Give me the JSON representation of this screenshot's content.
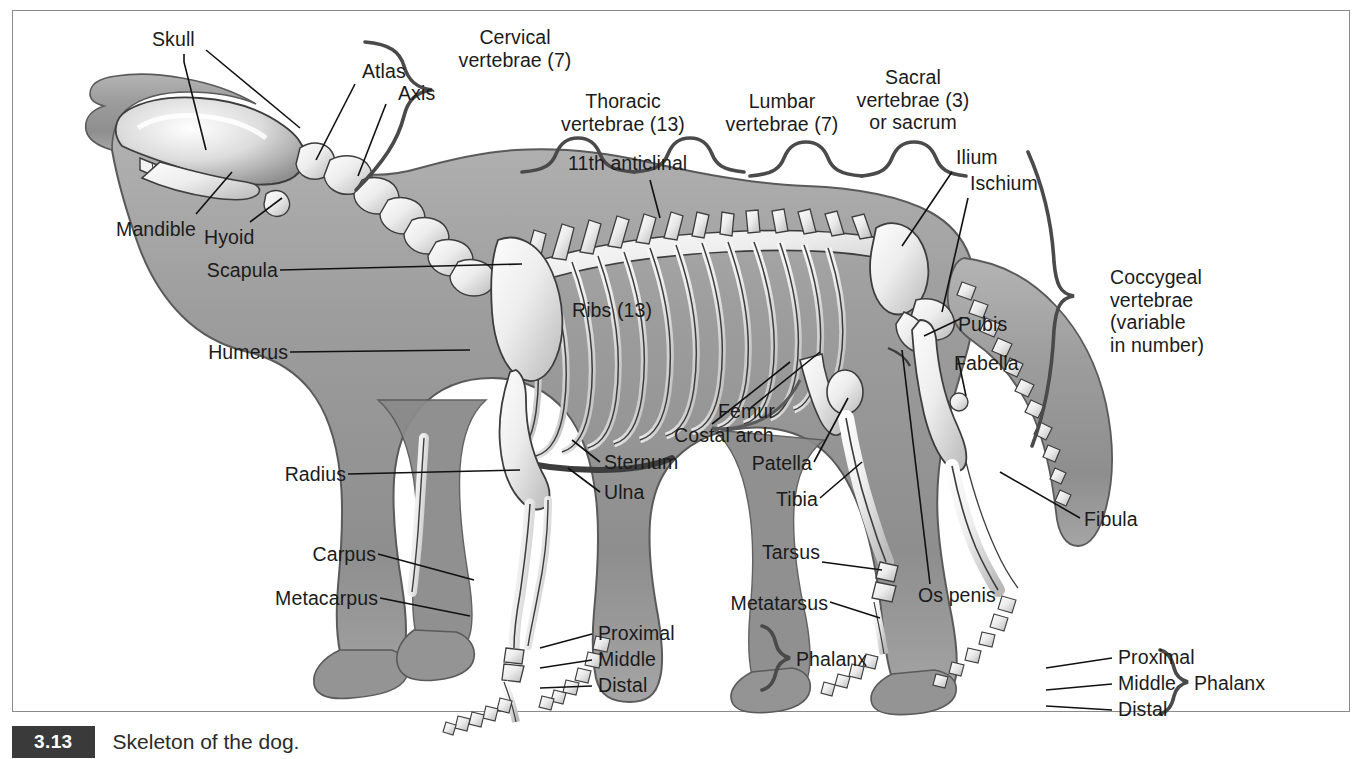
{
  "figure": {
    "caption_number": "3.13",
    "caption_text": "Skeleton of the dog."
  },
  "colors": {
    "body_fill": "#9a9a9a",
    "bone_fill": "#e8e8e8",
    "outline": "#3d3d3d",
    "leader_line": "#111111",
    "brace": "#4a4a4a",
    "frame": "#8a8a8a",
    "badge_bg": "#3a3a3a",
    "text": "#1b1b1b"
  },
  "labels": {
    "skull": "Skull",
    "atlas": "Atlas",
    "axis": "Axis",
    "mandible": "Mandible",
    "hyoid": "Hyoid",
    "scapula": "Scapula",
    "humerus": "Humerus",
    "radius": "Radius",
    "ulna": "Ulna",
    "sternum": "Sternum",
    "carpus": "Carpus",
    "metacarpus": "Metacarpus",
    "ribs": "Ribs (13)",
    "anticlinal": "11th anticlinal",
    "costal_arch": "Costal arch",
    "femur": "Femur",
    "patella": "Patella",
    "tibia": "Tibia",
    "fibula": "Fibula",
    "tarsus": "Tarsus",
    "metatarsus": "Metatarsus",
    "os_penis": "Os penis",
    "ilium": "Ilium",
    "ischium": "Ischium",
    "pubis": "Pubis",
    "fabella": "Fabella",
    "proximal": "Proximal",
    "middle": "Middle",
    "distal": "Distal",
    "phalanx": "Phalanx"
  },
  "group_labels": {
    "cervical": "Cervical\nvertebrae (7)",
    "thoracic": "Thoracic\nvertebrae (13)",
    "lumbar": "Lumbar\nvertebrae (7)",
    "sacral": "Sacral\nvertebrae (3)\nor sacrum",
    "coccygeal": "Coccygeal\nvertebrae\n(variable\nin number)"
  },
  "vertebrae_counts": {
    "cervical": 7,
    "thoracic": 13,
    "lumbar": 7,
    "sacral": 3,
    "coccygeal": "variable",
    "ribs": 13,
    "anticlinal_vertebra": 11
  }
}
